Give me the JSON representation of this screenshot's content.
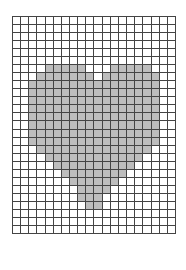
{
  "grid": {
    "columns": 20,
    "rows": 27,
    "fill_color": "#bdbdbd",
    "line_color": "#444444",
    "background_color": "#ffffff",
    "shape": "heart",
    "filled_ranges": [
      [],
      [],
      [],
      [],
      [],
      [],
      [
        [
          4,
          8
        ],
        [
          12,
          16
        ]
      ],
      [
        [
          3,
          9
        ],
        [
          11,
          17
        ]
      ],
      [
        [
          2,
          17
        ]
      ],
      [
        [
          2,
          17
        ]
      ],
      [
        [
          2,
          17
        ]
      ],
      [
        [
          2,
          17
        ]
      ],
      [
        [
          2,
          17
        ]
      ],
      [
        [
          2,
          17
        ]
      ],
      [
        [
          2,
          17
        ]
      ],
      [
        [
          2,
          17
        ]
      ],
      [
        [
          3,
          16
        ]
      ],
      [
        [
          4,
          15
        ]
      ],
      [
        [
          5,
          14
        ]
      ],
      [
        [
          6,
          13
        ]
      ],
      [
        [
          7,
          12
        ]
      ],
      [
        [
          8,
          11
        ]
      ],
      [
        [
          8,
          10
        ]
      ],
      [
        [
          9,
          10
        ]
      ],
      [],
      [],
      []
    ]
  }
}
